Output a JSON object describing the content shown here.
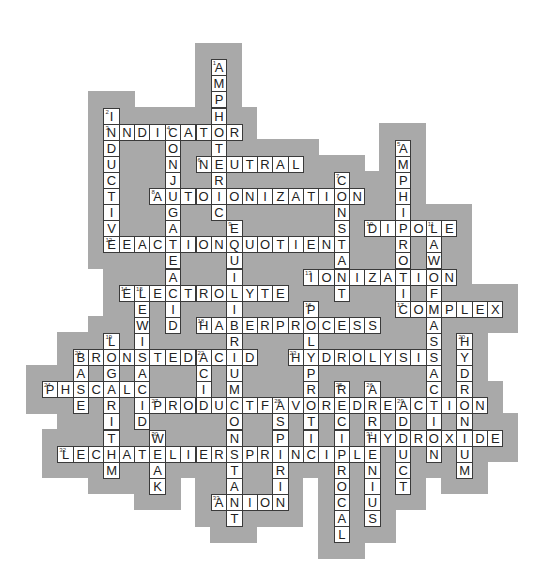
{
  "puzzle": {
    "title": "Acid-Base and Equilibrium Crossword",
    "grid": {
      "origin_x": 42,
      "origin_y": 27,
      "cell_w": 15.35,
      "cell_h": 16.1
    },
    "colors": {
      "background": "#ffffff",
      "region": "#a9a9a9",
      "cell": "#ffffff",
      "border": "#3a3a3a",
      "text": "#222222"
    },
    "words": [
      {
        "number": 1,
        "answer": "AMPHOTERIC",
        "dir": "down",
        "row": 2,
        "col": 11
      },
      {
        "number": 2,
        "answer": "INDUCTIVE",
        "dir": "down",
        "row": 5,
        "col": 4
      },
      {
        "number": 3,
        "answer": "INDICATOR",
        "dir": "across",
        "row": 6,
        "col": 4
      },
      {
        "number": 4,
        "answer": "CONJUGATEACID",
        "dir": "down",
        "row": 6,
        "col": 8
      },
      {
        "number": 5,
        "answer": "AMPHIPROTIC",
        "dir": "down",
        "row": 7,
        "col": 23
      },
      {
        "number": 6,
        "answer": "NEUTRAL",
        "dir": "across",
        "row": 8,
        "col": 10
      },
      {
        "number": 7,
        "answer": "CONSTANT",
        "dir": "down",
        "row": 9,
        "col": 19
      },
      {
        "number": 8,
        "answer": "AUTOIONIZATION",
        "dir": "across",
        "row": 10,
        "col": 7
      },
      {
        "number": 9,
        "answer": "EQUILIBRIUMCONSTANT",
        "dir": "down",
        "row": 12,
        "col": 12
      },
      {
        "number": 10,
        "answer": "DIPOLE",
        "dir": "across",
        "row": 12,
        "col": 21
      },
      {
        "number": 11,
        "answer": "LAWOFMASSACTION",
        "dir": "down",
        "row": 12,
        "col": 25
      },
      {
        "number": 12,
        "answer": "REACTIONQUOTIENT",
        "dir": "across",
        "row": 13,
        "col": 4
      },
      {
        "number": 13,
        "answer": "IONIZATION",
        "dir": "across",
        "row": 15,
        "col": 17
      },
      {
        "number": 14,
        "answer": "ELECTROLYTE",
        "dir": "across",
        "row": 16,
        "col": 5
      },
      {
        "number": 15,
        "answer": "LEWISACID",
        "dir": "down",
        "row": 16,
        "col": 6
      },
      {
        "number": 16,
        "answer": "POLYPROTIC",
        "dir": "down",
        "row": 17,
        "col": 17
      },
      {
        "number": 17,
        "answer": "COMPLEX",
        "dir": "across",
        "row": 17,
        "col": 23
      },
      {
        "number": 18,
        "answer": "HABERPROCESS",
        "dir": "across",
        "row": 18,
        "col": 10
      },
      {
        "number": 19,
        "answer": "LOGARITHM",
        "dir": "down",
        "row": 19,
        "col": 4
      },
      {
        "number": 20,
        "answer": "HYDRONIUM",
        "dir": "down",
        "row": 19,
        "col": 27
      },
      {
        "number": 21,
        "answer": "BRONSTEDACID",
        "dir": "across",
        "row": 20,
        "col": 2
      },
      {
        "number": 21,
        "answer": "BASE",
        "dir": "down",
        "row": 20,
        "col": 2
      },
      {
        "number": 22,
        "answer": "ACID",
        "dir": "down",
        "row": 20,
        "col": 10
      },
      {
        "number": 23,
        "answer": "HYDROLYSIS",
        "dir": "across",
        "row": 20,
        "col": 16
      },
      {
        "number": 24,
        "answer": "PHSCALE",
        "dir": "across",
        "row": 22,
        "col": 0
      },
      {
        "number": 25,
        "answer": "RECIPROCAL",
        "dir": "down",
        "row": 22,
        "col": 19
      },
      {
        "number": 26,
        "answer": "ARRHENIUS",
        "dir": "down",
        "row": 22,
        "col": 21
      },
      {
        "number": 27,
        "answer": "PRODUCTFAVOREDREACTION",
        "dir": "across",
        "row": 23,
        "col": 7
      },
      {
        "number": 28,
        "answer": "ASPIRIN",
        "dir": "down",
        "row": 23,
        "col": 15
      },
      {
        "number": 29,
        "answer": "ADDUCT",
        "dir": "down",
        "row": 23,
        "col": 23
      },
      {
        "number": 30,
        "answer": "WEAK",
        "dir": "down",
        "row": 25,
        "col": 7
      },
      {
        "number": 31,
        "answer": "HYDROXIDE",
        "dir": "across",
        "row": 25,
        "col": 21
      },
      {
        "number": 32,
        "answer": "LECHATELIERSPRINCIPLE",
        "dir": "across",
        "row": 26,
        "col": 1
      },
      {
        "number": 33,
        "answer": "ANION",
        "dir": "across",
        "row": 29,
        "col": 11
      }
    ]
  }
}
